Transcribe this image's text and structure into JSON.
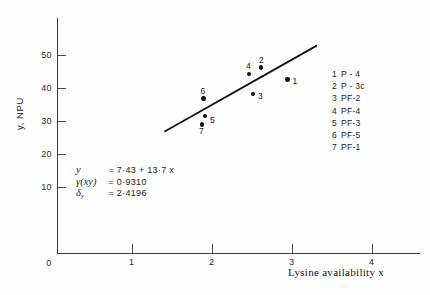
{
  "chart_data": {
    "type": "scatter",
    "title": "",
    "xlabel": "Lysine availability x",
    "ylabel": "y, NPU",
    "xlim": [
      0,
      4.6
    ],
    "ylim": [
      0,
      57
    ],
    "grid": false,
    "legend_position": "right",
    "x_ticks": [
      "1",
      "2",
      "3",
      "4"
    ],
    "x_tick_values": [
      1,
      2,
      3,
      4
    ],
    "y_ticks": [
      "10",
      "20",
      "30",
      "40",
      "50"
    ],
    "y_tick_values": [
      10,
      20,
      30,
      40,
      50
    ],
    "origin_label": "0",
    "points": [
      {
        "id": "1",
        "sample": "P - 4",
        "x": 2.95,
        "y": 42.5,
        "label_dx": 5,
        "label_dy": -4
      },
      {
        "id": "2",
        "sample": "P - 3c",
        "x": 2.62,
        "y": 46.2,
        "label_dx": -2,
        "label_dy": -13
      },
      {
        "id": "3",
        "sample": "PF-2",
        "x": 2.52,
        "y": 38.2,
        "label_dx": 5,
        "label_dy": -3
      },
      {
        "id": "4",
        "sample": "PF-4",
        "x": 2.47,
        "y": 44.2,
        "label_dx": -3,
        "label_dy": -13
      },
      {
        "id": "5",
        "sample": "PF-3",
        "x": 1.92,
        "y": 31.5,
        "label_dx": 5,
        "label_dy": -1
      },
      {
        "id": "6",
        "sample": "PF-5",
        "x": 1.9,
        "y": 36.8,
        "label_dx": -3,
        "label_dy": -13
      },
      {
        "id": "7",
        "sample": "PF-1",
        "x": 1.88,
        "y": 29.0,
        "label_dx": -3,
        "label_dy": 2
      }
    ],
    "fit_line": {
      "slope": 13.7,
      "intercept": 7.43,
      "x_start": 1.42,
      "x_end": 3.31
    },
    "annotations": {
      "equation_symbol": "y",
      "equation_value": "= 7·43 + 13·7 x",
      "correlation_symbol": "γ(xy)",
      "correlation_value": "= 0·9310",
      "sigma_symbol": "δ",
      "sigma_subscript": "y",
      "sigma_value": "= 2·4196"
    }
  },
  "legend": {
    "entries": [
      {
        "number": "1",
        "name": "P - 4"
      },
      {
        "number": "2",
        "name": "P - 3c"
      },
      {
        "number": "3",
        "name": "PF-2"
      },
      {
        "number": "4",
        "name": "PF-4"
      },
      {
        "number": "5",
        "name": "PF-3"
      },
      {
        "number": "6",
        "name": "PF-5"
      },
      {
        "number": "7",
        "name": "PF-1"
      }
    ]
  },
  "colors": {
    "axis": "#3a3a3a",
    "marker": "#121212",
    "line": "#141414",
    "text": "#1a1a1a",
    "background": "#fefefe"
  }
}
